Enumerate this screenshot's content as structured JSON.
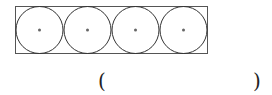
{
  "diagram": {
    "rectangle": {
      "x": 15.5,
      "y": 6.5,
      "width": 192,
      "height": 47,
      "stroke": "#555555"
    },
    "circles": [
      {
        "cx": 39.5,
        "cy": 30,
        "r": 23.5
      },
      {
        "cx": 87.5,
        "cy": 30,
        "r": 23.5
      },
      {
        "cx": 135.5,
        "cy": 30,
        "r": 23.5
      },
      {
        "cx": 183.5,
        "cy": 30,
        "r": 23.5
      }
    ],
    "circle_stroke": "#333333",
    "center_dot_color": "#666666"
  },
  "answer": {
    "open_paren": "(",
    "close_paren": ")"
  }
}
